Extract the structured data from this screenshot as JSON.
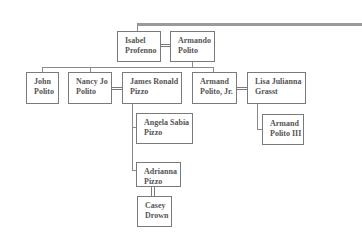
{
  "diagram": {
    "type": "family-tree",
    "people": {
      "isabel": {
        "line1": "Isabel",
        "line2": "Profenno"
      },
      "armando": {
        "line1": "Armando",
        "line2": "Polito"
      },
      "john": {
        "line1": "John",
        "line2": "Polito"
      },
      "nancy": {
        "line1": "Nancy Jo",
        "line2": "Polito"
      },
      "james": {
        "line1": "James Ronald",
        "line2": "Pizzo"
      },
      "armand_jr": {
        "line1": "Armand",
        "line2": "Polito, Jr."
      },
      "lisa": {
        "line1": "Lisa Julianna",
        "line2": "Grasst"
      },
      "angela": {
        "line1": "Angela Sabia",
        "line2": "Pizzo"
      },
      "adrianna": {
        "line1": "Adrianna",
        "line2": "Pizzo"
      },
      "casey": {
        "line1": "Casey",
        "line2": "Drown"
      },
      "armand_iii": {
        "line1": "Armand",
        "line2": "Polito III"
      }
    },
    "relationships": [
      {
        "type": "spouse",
        "a": "Isabel Profenno",
        "b": "Armando Polito"
      },
      {
        "type": "spouse",
        "a": "Nancy Jo Polito",
        "b": "James Ronald Pizzo"
      },
      {
        "type": "spouse",
        "a": "Armand Polito, Jr.",
        "b": "Lisa Julianna Grasst"
      },
      {
        "type": "children",
        "parents": "Isabel Profenno & Armando Polito",
        "children": [
          "John Polito",
          "Nancy Jo Polito",
          "Armand Polito, Jr."
        ]
      },
      {
        "type": "children",
        "parents": "Nancy Jo Polito & James Ronald Pizzo",
        "children": [
          "Angela Sabia Pizzo",
          "Adrianna Pizzo"
        ]
      },
      {
        "type": "children",
        "parents": "Armand Polito, Jr. & Lisa Julianna Grasst",
        "children": [
          "Armand Polito III"
        ]
      },
      {
        "type": "spouse",
        "a": "Adrianna Pizzo",
        "b": "Casey Drown"
      }
    ]
  }
}
